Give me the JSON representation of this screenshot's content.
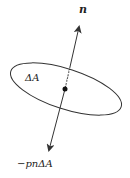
{
  "figure": {
    "labels": {
      "normal": "n",
      "area": "ΔA",
      "force": "−pnΔA"
    },
    "colors": {
      "stroke": "#333333",
      "background": "#ffffff"
    }
  }
}
